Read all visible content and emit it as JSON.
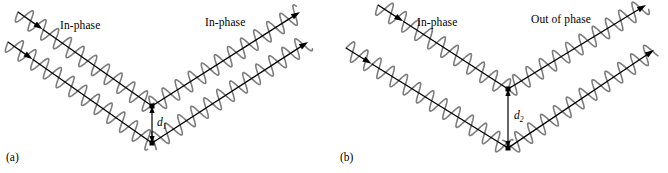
{
  "figure": {
    "background_color": "#ffffff",
    "wave_color": "#7d7d7d",
    "ray_color": "#000000",
    "panels": [
      {
        "id": "a",
        "caption": "(a)",
        "caption_pos": {
          "x": 6,
          "y": 152
        },
        "labels": [
          {
            "name": "in-phase-incoming",
            "text": "In-phase",
            "x": 60,
            "y": 20
          },
          {
            "name": "in-phase-outgoing",
            "text": "In-phase",
            "x": 205,
            "y": 17
          }
        ],
        "distance": {
          "symbol": "d",
          "subscript": "1",
          "label_x": 157,
          "label_y": 117,
          "arrow_x": 152,
          "arrow_top_y": 106,
          "arrow_bottom_y": 143
        },
        "beams": [
          {
            "name": "upper-beam",
            "in_start": {
              "x": 18,
              "y": 12
            },
            "vertex": {
              "x": 152,
              "y": 106
            },
            "out_end": {
              "x": 300,
              "y": 12
            },
            "wave_phase_deg": 0
          },
          {
            "name": "lower-beam",
            "in_start": {
              "x": 8,
              "y": 42
            },
            "vertex": {
              "x": 152,
              "y": 143
            },
            "out_end": {
              "x": 308,
              "y": 42
            },
            "wave_phase_deg": 0
          }
        ]
      },
      {
        "id": "b",
        "caption": "(b)",
        "caption_pos": {
          "x": 6,
          "y": 152
        },
        "labels": [
          {
            "name": "in-phase-incoming",
            "text": "In-phase",
            "x": 83,
            "y": 17
          },
          {
            "name": "out-of-phase-outgoing",
            "text": "Out of phase",
            "x": 197,
            "y": 14
          }
        ],
        "distance": {
          "symbol": "d",
          "subscript": "2",
          "label_x": 180,
          "label_y": 110,
          "arrow_x": 174,
          "arrow_top_y": 89,
          "arrow_bottom_y": 148
        },
        "beams": [
          {
            "name": "upper-beam",
            "in_start": {
              "x": 44,
              "y": 5
            },
            "vertex": {
              "x": 174,
              "y": 89
            },
            "out_end": {
              "x": 312,
              "y": 5
            },
            "wave_phase_deg": 0
          },
          {
            "name": "lower-beam",
            "in_start": {
              "x": 12,
              "y": 48
            },
            "vertex": {
              "x": 174,
              "y": 148
            },
            "out_end": {
              "x": 320,
              "y": 50
            },
            "wave_phase_deg": 180
          }
        ]
      }
    ],
    "wave": {
      "wavelength_px": 15.5,
      "amplitude_px": 9.5,
      "stroke_width": 1.6
    },
    "ray": {
      "stroke_width": 1.3,
      "arrowhead_length": 9,
      "arrowhead_width": 6
    },
    "vertex_marker": {
      "shape": "square",
      "size": 5,
      "color": "#000000"
    }
  }
}
